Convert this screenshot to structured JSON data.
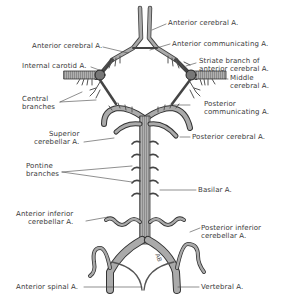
{
  "figure": {
    "labels": {
      "anterior_cerebral_top": "Anterior cerebral A.",
      "anterior_cerebral_left": "Anterior cerebral A.",
      "anterior_communicating": "Anterior communicating A.",
      "internal_carotid": "Internal carotid A.",
      "striate_branch": [
        "Striate branch of",
        "anterior cerebral A."
      ],
      "middle_cerebral": [
        "Middle",
        "cerebral A."
      ],
      "central_branches": [
        "Central",
        "branches"
      ],
      "posterior_communicating": [
        "Posterior",
        "communicating A."
      ],
      "superior_cerebellar": [
        "Superior",
        "cerebellar A."
      ],
      "posterior_cerebral": "Posterior cerebral A.",
      "pontine_branches": [
        "Pontine",
        "branches"
      ],
      "basilar": "Basilar A.",
      "anterior_inferior_cerebellar": [
        "Anterior inferior",
        "cerebellar A."
      ],
      "posterior_inferior_cerebellar": [
        "Posterior inferior",
        "cerebellar A."
      ],
      "anterior_spinal": "Anterior spinal A.",
      "vertebral": "Vertebral A."
    },
    "signature": "AB"
  },
  "colors": {
    "vessel_fill": "#9a9a9a",
    "vessel_stroke": "#3c3c3c",
    "leader_line": "#444444",
    "text": "#3a3a3a"
  }
}
